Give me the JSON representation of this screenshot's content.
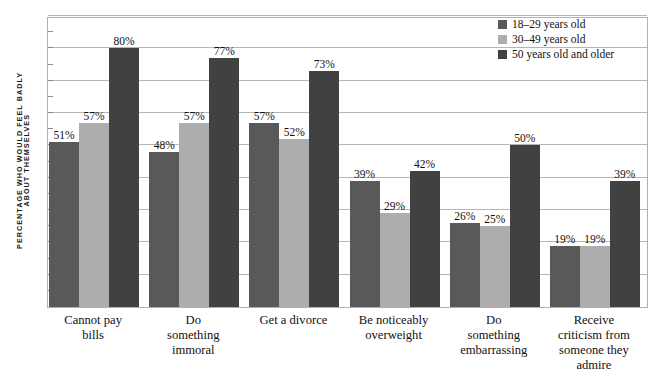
{
  "chart_data": {
    "type": "bar",
    "title": "",
    "subtitle": "",
    "xlabel": "",
    "ylabel": "PERCENTAGE WHO WOULD FEEL BADLY ABOUT THEMSELVES",
    "ylabel_lines": [
      "PERCENTAGE WHO WOULD FEEL BADLY",
      "ABOUT THEMSELVES"
    ],
    "ylim": [
      0,
      90
    ],
    "grid": true,
    "gridline_step": 10,
    "legend_position": "top-right",
    "value_suffix": "%",
    "categories": [
      "Cannot pay bills",
      "Do something immoral",
      "Get a divorce",
      "Be noticeably overweight",
      "Do something embarrassing",
      "Receive criticism from someone they admire"
    ],
    "category_label_lines": [
      [
        "Cannot pay",
        "bills"
      ],
      [
        "Do",
        "something",
        "immoral"
      ],
      [
        "Get a divorce"
      ],
      [
        "Be noticeably",
        "overweight"
      ],
      [
        "Do",
        "something",
        "embarrassing"
      ],
      [
        "Receive",
        "criticism from",
        "someone they",
        "admire"
      ]
    ],
    "series": [
      {
        "name": "18–29 years old",
        "color": "#595959",
        "values": [
          51,
          48,
          57,
          39,
          26,
          19
        ],
        "labels": [
          "51%",
          "48%",
          "57%",
          "39%",
          "26%",
          "19%"
        ]
      },
      {
        "name": "30–49 years old",
        "color": "#adadad",
        "values": [
          57,
          57,
          52,
          29,
          25,
          19
        ],
        "labels": [
          "57%",
          "57%",
          "52%",
          "29%",
          "25%",
          "19%"
        ]
      },
      {
        "name": "50 years old and older",
        "color": "#414141",
        "values": [
          80,
          77,
          73,
          42,
          50,
          39
        ],
        "labels": [
          "80%",
          "77%",
          "73%",
          "42%",
          "50%",
          "39%"
        ]
      }
    ]
  },
  "legend": {
    "items": [
      {
        "label": "18–29 years old",
        "color": "#595959"
      },
      {
        "label": "30–49 years old",
        "color": "#adadad"
      },
      {
        "label": "50 years old and older",
        "color": "#414141"
      }
    ]
  },
  "colors": {
    "plot_border": "#b0b0b0",
    "gridline": "#b5b5b5",
    "background": "#ffffff",
    "text": "#111111"
  }
}
